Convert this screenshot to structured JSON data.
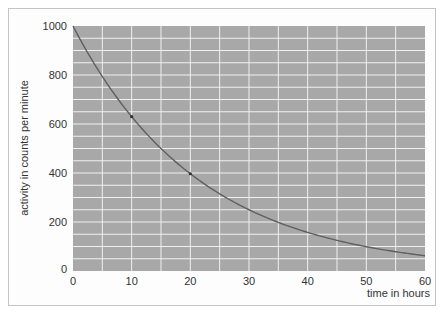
{
  "chart_data": {
    "type": "line",
    "title": "",
    "xlabel": "time in hours",
    "ylabel": "activity in counts per minute",
    "xlim": [
      0,
      60
    ],
    "ylim": [
      0,
      1000
    ],
    "x_ticks": [
      0,
      10,
      20,
      30,
      40,
      50,
      60
    ],
    "y_ticks": [
      0,
      200,
      400,
      600,
      800,
      1000
    ],
    "x_gridlines_every": 5,
    "y_gridlines_every": 50,
    "grid": true,
    "legend": null,
    "series": [
      {
        "name": "radioactive decay (half-life 15 h)",
        "x": [
          0,
          5,
          10,
          15,
          20,
          25,
          30,
          35,
          40,
          45,
          50,
          55,
          60
        ],
        "values": [
          1000,
          794,
          630,
          500,
          397,
          315,
          250,
          198,
          157,
          125,
          99,
          79,
          62
        ]
      }
    ],
    "markers": [
      {
        "x": 10,
        "y": 630
      },
      {
        "x": 20,
        "y": 397
      }
    ],
    "colors": {
      "plot_background": "#a8a8a8",
      "gridline": "#f0f0f0",
      "curve": "#5f5f5f",
      "frame": "#c4c4c4"
    }
  }
}
